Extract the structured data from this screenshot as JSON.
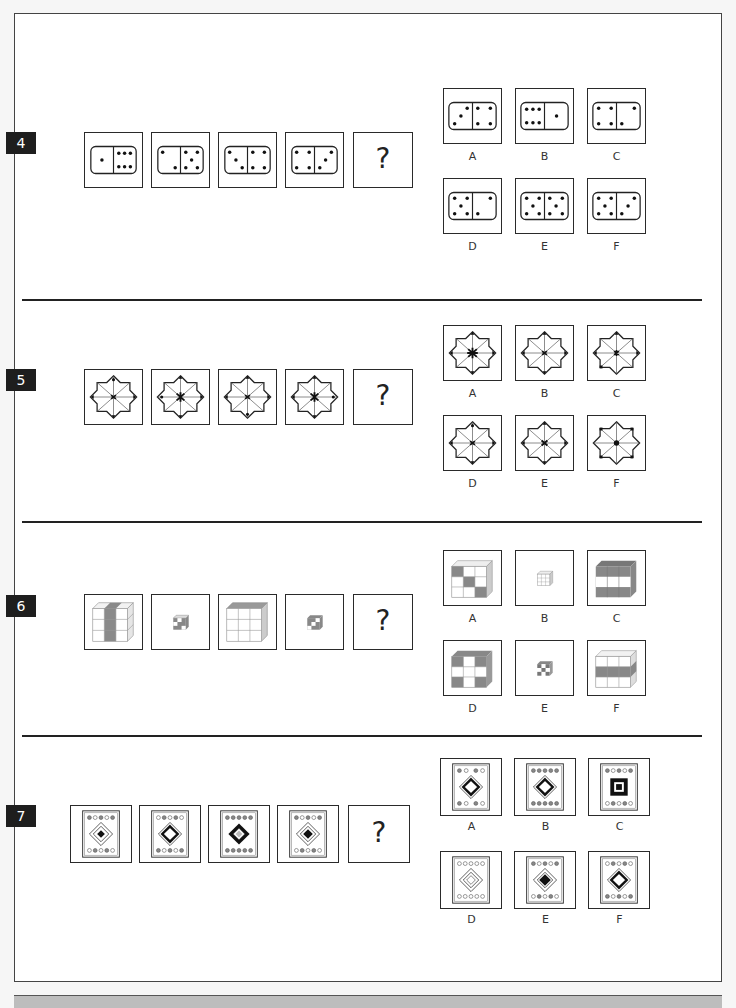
{
  "questions": [
    {
      "number": "4",
      "type": "domino",
      "sequence": [
        {
          "left": 1,
          "right": 6
        },
        {
          "left": 2,
          "right": 5
        },
        {
          "left": 3,
          "right": 4
        },
        {
          "left": 4,
          "right": 3
        }
      ],
      "question_mark": "?",
      "options": [
        {
          "label": "A",
          "left": 3,
          "right": 4
        },
        {
          "label": "B",
          "left": 6,
          "right": 1
        },
        {
          "label": "C",
          "left": 4,
          "right": 3
        },
        {
          "label": "D",
          "left": 5,
          "right": 2
        },
        {
          "label": "E",
          "left": 5,
          "right": 5
        },
        {
          "label": "F",
          "left": 5,
          "right": 3
        }
      ]
    },
    {
      "number": "5",
      "type": "star",
      "question_mark": "?",
      "options": [
        {
          "label": "A"
        },
        {
          "label": "B"
        },
        {
          "label": "C"
        },
        {
          "label": "D"
        },
        {
          "label": "E"
        },
        {
          "label": "F"
        }
      ]
    },
    {
      "number": "6",
      "type": "cube",
      "question_mark": "?",
      "options": [
        {
          "label": "A"
        },
        {
          "label": "B"
        },
        {
          "label": "C"
        },
        {
          "label": "D"
        },
        {
          "label": "E"
        },
        {
          "label": "F"
        }
      ]
    },
    {
      "number": "7",
      "type": "card",
      "question_mark": "?",
      "options": [
        {
          "label": "A"
        },
        {
          "label": "B"
        },
        {
          "label": "C"
        },
        {
          "label": "D"
        },
        {
          "label": "E"
        },
        {
          "label": "F"
        }
      ]
    }
  ]
}
